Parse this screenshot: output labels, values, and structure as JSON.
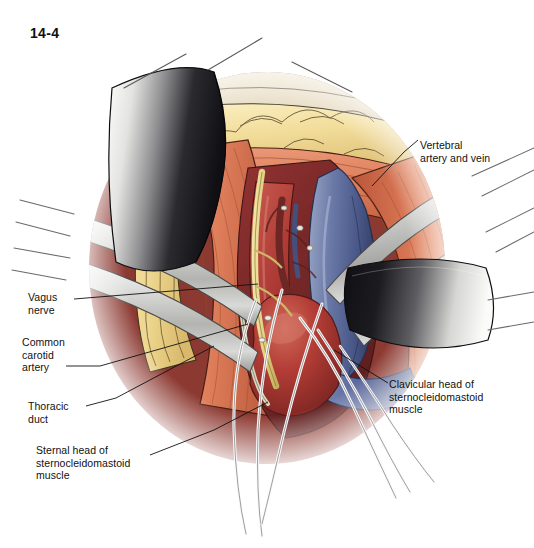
{
  "figure": {
    "number": "14-4",
    "domain": "surgical-anatomy-illustration"
  },
  "callouts": [
    {
      "id": "vertebral",
      "text": "Vertebral\nartery and vein",
      "x": 420,
      "y": 139,
      "side": "right"
    },
    {
      "id": "vagus",
      "text": "Vagus\nnerve",
      "x": 28,
      "y": 291,
      "side": "left"
    },
    {
      "id": "carotid",
      "text": "Common\ncarotid\nartery",
      "x": 22,
      "y": 336,
      "side": "left"
    },
    {
      "id": "thoracic",
      "text": "Thoracic\nduct",
      "x": 28,
      "y": 400,
      "side": "left"
    },
    {
      "id": "sternal",
      "text": "Sternal head of\nsternocleidomastoid\nmuscle",
      "x": 36,
      "y": 444,
      "side": "left"
    },
    {
      "id": "clavicular",
      "text": "Clavicular head of\nsternocleidomastoid\nmuscle",
      "x": 389,
      "y": 378,
      "side": "right"
    }
  ],
  "palette": {
    "background": "#ffffff",
    "ink": "#111111",
    "skin_edge": "#e8ddc6",
    "fat_light": "#f6e3a8",
    "fat_mid": "#e9cf85",
    "fat_shadow": "#d8b969",
    "muscle_light": "#e8916e",
    "muscle_mid": "#d9714f",
    "muscle_dark": "#b9563c",
    "artery_bright": "#b83a35",
    "artery_deep": "#8e2a28",
    "artery_dark": "#6e2423",
    "vein_light": "#8f9cc0",
    "vein_mid": "#5f6e9b",
    "vein_dark": "#3d4a75",
    "nerve_yellow": "#e8d98a",
    "metal_light": "#f2f2f0",
    "metal_mid": "#c9c9c6",
    "metal_dark": "#8f8f8d",
    "blade_black": "#15151a",
    "blade_grey": "#6a6a6e",
    "suture_white": "#fafafa",
    "suture_edge": "#6d6d70"
  }
}
